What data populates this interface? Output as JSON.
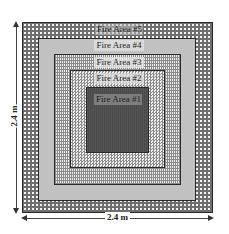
{
  "diagram": {
    "type": "nested-squares",
    "areas": [
      {
        "id": 5,
        "label": "Fire Area #5",
        "pattern": "dotted-grid",
        "color": "#6f6f6f"
      },
      {
        "id": 4,
        "label": "Fire Area #4",
        "pattern": "stipple",
        "color": "#e4e4e4"
      },
      {
        "id": 3,
        "label": "Fire Area #3",
        "pattern": "brick",
        "color": "#efefef"
      },
      {
        "id": 2,
        "label": "Fire Area #2",
        "pattern": "checkerboard",
        "color": "#8c8c8c"
      },
      {
        "id": 1,
        "label": "Fire Area #1",
        "pattern": "solid-dark",
        "color": "#4d4d4d"
      }
    ],
    "dimensions": {
      "width_label": "2.4 m",
      "height_label": "2.4 m"
    }
  }
}
